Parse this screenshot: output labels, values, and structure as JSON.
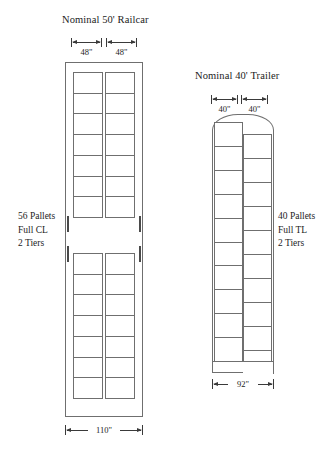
{
  "figure": {
    "background_color": "#ffffff",
    "line_color": "#6f6f6f",
    "text_color": "#1c1c1c"
  },
  "railcar": {
    "title": "Nominal 50' Railcar",
    "pallet_width_left": "48\"",
    "pallet_width_right": "48\"",
    "overall_width": "110\"",
    "notes": {
      "line1": "56 Pallets",
      "line2": "Full CL",
      "line3": "2 Tiers"
    },
    "sections": [
      {
        "rows": 7,
        "columns": 2
      },
      {
        "rows": 7,
        "columns": 2
      }
    ]
  },
  "trailer": {
    "title": "Nominal 40' Trailer",
    "pallet_width_left": "40\"",
    "pallet_width_right": "40\"",
    "overall_width": "92\"",
    "notes": {
      "line1": "40 Pallets",
      "line2": "Full TL",
      "line3": "2 Tiers"
    },
    "left_column_rows": 10,
    "right_column_rows": 10,
    "staggered": true
  }
}
